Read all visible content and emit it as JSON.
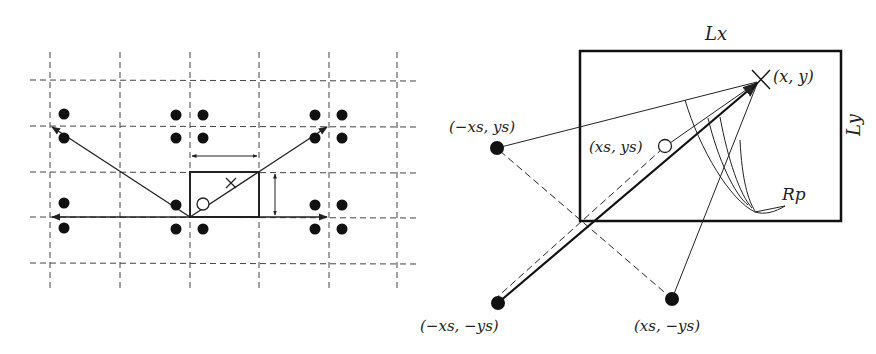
{
  "figure": {
    "left_panel": {
      "description": "Image-source lattice: room rectangle repeated on dashed grid with mirrored sources",
      "grid": {
        "vertical_lines_x": [
          50,
          120,
          190,
          259,
          329,
          397
        ],
        "horizontal_lines_y": [
          80,
          126,
          172,
          217,
          264
        ],
        "y_range": [
          52,
          288
        ]
      },
      "room": {
        "x": 190,
        "y": 172,
        "w": 69,
        "h": 45
      },
      "source_marker": {
        "cx": 203,
        "cy": 204,
        "r": 6
      },
      "receiver_marker": {
        "cx": 231,
        "cy": 183
      },
      "image_dots": [
        [
          64,
          114
        ],
        [
          64,
          138
        ],
        [
          64,
          203
        ],
        [
          64,
          228
        ],
        [
          176,
          115
        ],
        [
          203,
          115
        ],
        [
          176,
          138
        ],
        [
          203,
          138
        ],
        [
          176,
          205
        ],
        [
          176,
          229
        ],
        [
          203,
          229
        ],
        [
          315,
          115
        ],
        [
          342,
          115
        ],
        [
          315,
          138
        ],
        [
          342,
          138
        ],
        [
          315,
          205
        ],
        [
          342,
          205
        ],
        [
          315,
          229
        ],
        [
          342,
          229
        ]
      ],
      "width_arrow": {
        "x1": 190,
        "x2": 259,
        "y": 156
      },
      "height_arrow": {
        "x": 275,
        "y1": 172,
        "y2": 217
      }
    },
    "right_panel": {
      "room": {
        "x": 580,
        "y": 51,
        "w": 261,
        "h": 170
      },
      "labels": {
        "Lx": "Lx",
        "Ly": "Ly",
        "receiver": "(x, y)",
        "source": "(xs, ys)",
        "image_1": "(−xs, ys)",
        "image_2": "(−xs, −ys)",
        "image_3": "(xs, −ys)",
        "region": "Rp"
      },
      "receiver": {
        "cx": 760,
        "cy": 80
      },
      "source": {
        "cx": 665,
        "cy": 146
      },
      "images": [
        {
          "cx": 497,
          "cy": 148,
          "label_key": "image_1"
        },
        {
          "cx": 498,
          "cy": 303,
          "label_key": "image_2"
        },
        {
          "cx": 672,
          "cy": 299,
          "label_key": "image_3"
        }
      ]
    }
  }
}
